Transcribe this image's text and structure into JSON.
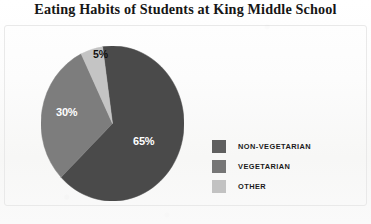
{
  "chart_data": {
    "type": "pie",
    "title": "Eating Habits of Students at King Middle School",
    "categories": [
      "NON-VEGETARIAN",
      "VEGETARIAN",
      "OTHER"
    ],
    "values": [
      65,
      30,
      5
    ],
    "value_labels": [
      "65%",
      "30%",
      "5%"
    ],
    "units": "percent",
    "colors": [
      "#4a4a4a",
      "#7d7d7d",
      "#c4c4c4"
    ],
    "legend_position": "right",
    "grid": false,
    "start_angle_deg": 352,
    "direction": "clockwise",
    "xlabel": "",
    "ylabel": ""
  },
  "title": {
    "text": "Eating Habits of Students at King Middle School"
  },
  "pie": {
    "slices": [
      {
        "label": "65%",
        "name": "non-vegetarian",
        "value": 65,
        "color": "#4a4a4a",
        "label_color": "light"
      },
      {
        "label": "30%",
        "name": "vegetarian",
        "value": 30,
        "color": "#7d7d7d",
        "label_color": "light"
      },
      {
        "label": "5%",
        "name": "other",
        "value": 5,
        "color": "#c4c4c4",
        "label_color": "dark"
      }
    ]
  },
  "legend": {
    "items": [
      {
        "label": "NON-VEGETARIAN",
        "color": "#5f5f5f"
      },
      {
        "label": "VEGETARIAN",
        "color": "#767676"
      },
      {
        "label": "OTHER",
        "color": "#c2c2c2"
      }
    ]
  }
}
